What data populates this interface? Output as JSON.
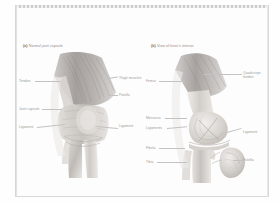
{
  "page": {
    "background_color": "#fdfdfd",
    "border_color": "#d8d8d8",
    "label_color": "#9a9a9a",
    "caption_color": "#8c8c8c"
  },
  "panel_a": {
    "caption_tag": "(a)",
    "caption_text": "Normal joint capsule",
    "labels_left": [
      {
        "text": "Tendon"
      },
      {
        "text": "Joint capsule"
      },
      {
        "text": "Ligament"
      }
    ],
    "labels_right": [
      {
        "text": "Thigh muscles"
      },
      {
        "text": "Patella"
      },
      {
        "text": "Ligament"
      }
    ]
  },
  "panel_b": {
    "caption_tag": "(b)",
    "caption_text": "View of knee's interior",
    "labels_left": [
      {
        "text": "Femur"
      },
      {
        "text": "Meniscus"
      },
      {
        "text": "Ligaments"
      },
      {
        "text": "Fibula"
      },
      {
        "text": "Tibia"
      }
    ],
    "labels_right": [
      {
        "text": "Quadriceps tendon"
      },
      {
        "text": "Ligament"
      },
      {
        "text": "Patella"
      }
    ]
  }
}
